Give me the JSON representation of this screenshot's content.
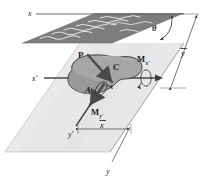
{
  "figure": {
    "background_color": "#ffffff",
    "colors": {
      "cut_plane": "#7d7d7d",
      "cut_plane_hatch": "#f2f2f2",
      "reference_plane": "#e7e7e7",
      "reference_plane_edge": "#9a9a9a",
      "cross_section_fill": "#a6a6a6",
      "cross_section_fill_dark": "#8f8f8f",
      "outline": "#3a3a3a",
      "arrow": "#4a4a4a",
      "axis_line": "#6d6d6d",
      "label": "#1a1a1a"
    },
    "labels": {
      "x_axis": "x",
      "x_prime_axis": "x'",
      "y_axis": "y",
      "y_prime_axis": "y'",
      "theta": "θ",
      "y_bar": "y",
      "y_bar_overbar": "̄",
      "x_bar": "x",
      "point_p": "P",
      "centroid_c": "C",
      "area_a": "A",
      "moment_x_prime_base": "M",
      "moment_x_prime_sub": "x'",
      "moment_y_prime_base": "M",
      "moment_y_prime_sub": "y'"
    },
    "annotations": {
      "dimension_y_bar": "ȳ",
      "dimension_x_bar": "x̄",
      "moment_x_prime": "M x'",
      "moment_y_prime": "M y'"
    }
  }
}
